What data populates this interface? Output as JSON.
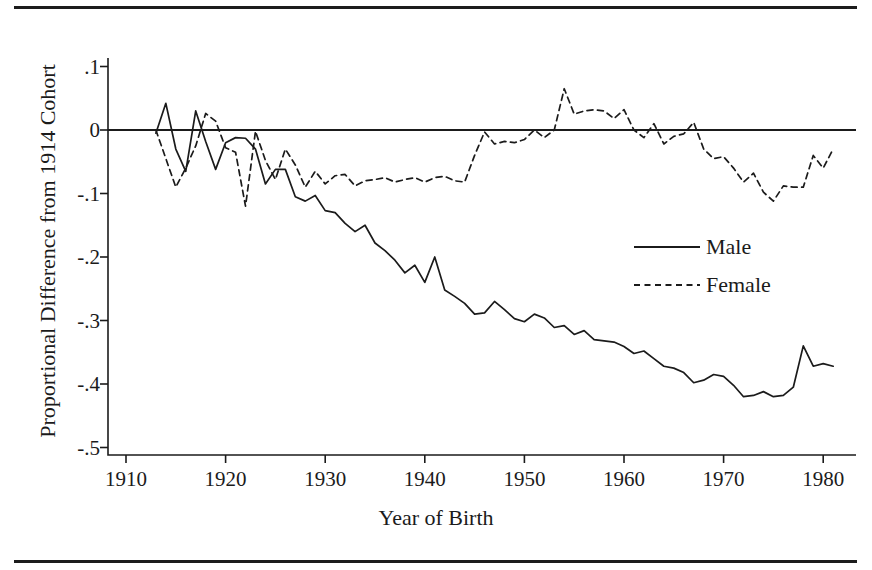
{
  "figure": {
    "xlabel": "Year of Birth",
    "ylabel": "Proportional Difference from 1914 Cohort",
    "rule_top": "horizontal-rule",
    "rule_bottom": "horizontal-rule"
  },
  "legend": {
    "male": "Male",
    "female": "Female"
  },
  "axis": {
    "yticks": [
      ".1",
      "0",
      "-.1",
      "-.2",
      "-.3",
      "-.4",
      "-.5"
    ],
    "xticks": [
      "1910",
      "1920",
      "1930",
      "1940",
      "1950",
      "1960",
      "1970",
      "1980"
    ]
  },
  "chart_data": {
    "type": "line",
    "title": "",
    "xlabel": "Year of Birth",
    "ylabel": "Proportional Difference from 1914 Cohort",
    "xlim": [
      1908,
      1983
    ],
    "ylim": [
      -0.52,
      0.12
    ],
    "yticks": [
      0.1,
      0.0,
      -0.1,
      -0.2,
      -0.3,
      -0.4,
      -0.5
    ],
    "ytick_labels": [
      ".1",
      "0",
      "-.1",
      "-.2",
      "-.3",
      "-.4",
      "-.5"
    ],
    "xticks": [
      1910,
      1920,
      1930,
      1940,
      1950,
      1960,
      1970,
      1980
    ],
    "xtick_labels": [
      "1910",
      "1920",
      "1930",
      "1940",
      "1950",
      "1960",
      "1970",
      "1980"
    ],
    "grid": false,
    "legend_position": "center-right",
    "reference_line": {
      "y": 0.0,
      "style": "solid"
    },
    "series": [
      {
        "name": "Male",
        "style": "solid",
        "color": "#1b1b1b",
        "x": [
          1913,
          1914,
          1915,
          1916,
          1917,
          1918,
          1919,
          1920,
          1921,
          1922,
          1923,
          1924,
          1925,
          1926,
          1927,
          1928,
          1929,
          1930,
          1931,
          1932,
          1933,
          1934,
          1935,
          1936,
          1937,
          1938,
          1939,
          1940,
          1941,
          1942,
          1943,
          1944,
          1945,
          1946,
          1947,
          1948,
          1949,
          1950,
          1951,
          1952,
          1953,
          1954,
          1955,
          1956,
          1957,
          1958,
          1959,
          1960,
          1961,
          1962,
          1963,
          1964,
          1965,
          1966,
          1967,
          1968,
          1969,
          1970,
          1971,
          1972,
          1973,
          1974,
          1975,
          1976,
          1977,
          1978,
          1979,
          1980,
          1981
        ],
        "y": [
          -0.005,
          0.042,
          -0.03,
          -0.065,
          0.03,
          -0.018,
          -0.062,
          -0.02,
          -0.012,
          -0.013,
          -0.03,
          -0.085,
          -0.062,
          -0.062,
          -0.105,
          -0.112,
          -0.103,
          -0.127,
          -0.13,
          -0.147,
          -0.16,
          -0.15,
          -0.178,
          -0.19,
          -0.205,
          -0.225,
          -0.213,
          -0.24,
          -0.2,
          -0.252,
          -0.262,
          -0.273,
          -0.29,
          -0.288,
          -0.27,
          -0.283,
          -0.297,
          -0.302,
          -0.29,
          -0.296,
          -0.311,
          -0.308,
          -0.322,
          -0.316,
          -0.33,
          -0.332,
          -0.334,
          -0.341,
          -0.352,
          -0.348,
          -0.36,
          -0.372,
          -0.375,
          -0.382,
          -0.398,
          -0.394,
          -0.385,
          -0.388,
          -0.402,
          -0.42,
          -0.418,
          -0.412,
          -0.42,
          -0.418,
          -0.405,
          -0.34,
          -0.372,
          -0.368,
          -0.372
        ]
      },
      {
        "name": "Female",
        "style": "dashed",
        "color": "#1b1b1b",
        "x": [
          1913,
          1914,
          1915,
          1916,
          1917,
          1918,
          1919,
          1920,
          1921,
          1922,
          1923,
          1924,
          1925,
          1926,
          1927,
          1928,
          1929,
          1930,
          1931,
          1932,
          1933,
          1934,
          1935,
          1936,
          1937,
          1938,
          1939,
          1940,
          1941,
          1942,
          1943,
          1944,
          1945,
          1946,
          1947,
          1948,
          1949,
          1950,
          1951,
          1952,
          1953,
          1954,
          1955,
          1956,
          1957,
          1958,
          1959,
          1960,
          1961,
          1962,
          1963,
          1964,
          1965,
          1966,
          1967,
          1968,
          1969,
          1970,
          1971,
          1972,
          1973,
          1974,
          1975,
          1976,
          1977,
          1978,
          1979,
          1980,
          1981
        ],
        "y": [
          0.0,
          -0.045,
          -0.09,
          -0.06,
          -0.025,
          0.026,
          0.014,
          -0.028,
          -0.035,
          -0.12,
          -0.002,
          -0.048,
          -0.078,
          -0.03,
          -0.055,
          -0.09,
          -0.065,
          -0.085,
          -0.072,
          -0.07,
          -0.088,
          -0.08,
          -0.078,
          -0.075,
          -0.082,
          -0.078,
          -0.075,
          -0.082,
          -0.075,
          -0.073,
          -0.08,
          -0.082,
          -0.04,
          -0.003,
          -0.022,
          -0.018,
          -0.02,
          -0.015,
          0.0,
          -0.012,
          0.0,
          0.065,
          0.025,
          0.03,
          0.032,
          0.03,
          0.018,
          0.032,
          0.0,
          -0.012,
          0.01,
          -0.022,
          -0.01,
          -0.006,
          0.012,
          -0.03,
          -0.045,
          -0.042,
          -0.06,
          -0.082,
          -0.068,
          -0.098,
          -0.112,
          -0.088,
          -0.09,
          -0.09,
          -0.04,
          -0.06,
          -0.03
        ]
      }
    ]
  }
}
